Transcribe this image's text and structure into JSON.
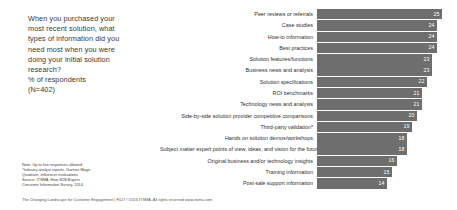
{
  "question": {
    "lines": [
      "When you purchased your",
      "most recent solution, what",
      "types of information did you",
      "need most when you were",
      "doing your initial solution",
      "research?",
      "% of respondents",
      "(N=402)"
    ]
  },
  "footnote": {
    "lines": [
      "Note: Up to five responses allowed",
      "*Industry analyst reports, Gartner Magic",
      "Quadrant, influencer evaluations",
      "Source: ITSMA, How B2B Buyers",
      "Consume Information Survey, 2014"
    ]
  },
  "footer": {
    "text": "The Changing Landscape for Customer Engagement  | F027 ©2016 ITSMA. All rights reserved  www.itsma.com"
  },
  "colors": {
    "bar": "#6e6e6e",
    "value_label": "#ffffff",
    "text": "#2f2f2f",
    "background": "#ffffff"
  },
  "chart_data": {
    "type": "bar",
    "orientation": "horizontal",
    "title": "",
    "xlabel": "",
    "ylabel": "",
    "xlim": [
      0,
      27
    ],
    "grid": false,
    "legend": false,
    "value_suffix": "",
    "categories": [
      "Peer reviews or referrals",
      "Case studies",
      "How-to information",
      "Best practices",
      "Solution features/functions",
      "Business news and analysis",
      "Solution specifications",
      "ROI benchmarks",
      "Technology news and analysis",
      "Side-by-side solution provider competitive comparisons",
      "Third-party validation*",
      "Hands on solution demos/workshops",
      "Subject matter expert points of view, ideas, and vision for the future",
      "Original business and/or technology insights",
      "Training information",
      "Post-sale support information"
    ],
    "values": [
      25,
      24,
      24,
      24,
      23,
      23,
      22,
      21,
      21,
      20,
      19,
      18,
      18,
      16,
      15,
      14
    ]
  }
}
